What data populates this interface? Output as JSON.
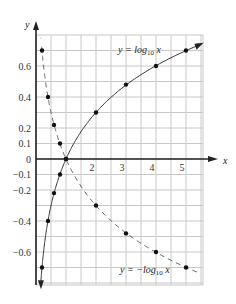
{
  "chart_data": {
    "type": "line",
    "title": "",
    "xlabel": "x",
    "ylabel": "y",
    "xlim": [
      0,
      5.5
    ],
    "ylim": [
      -0.8,
      0.8
    ],
    "grid": true,
    "legend_position": "inline",
    "x_ticks": [
      "1",
      "2",
      "3",
      "4",
      "5"
    ],
    "x_tick_values": [
      1,
      2,
      3,
      4,
      5
    ],
    "y_ticks": [
      "0.6",
      "0.4",
      "0.2",
      "0.1",
      "0",
      "-0.1",
      "-0.2",
      "-0.4",
      "-0.6"
    ],
    "y_tick_values": [
      0.6,
      0.4,
      0.2,
      0.1,
      0,
      -0.1,
      -0.2,
      -0.4,
      -0.6
    ],
    "series": [
      {
        "name": "y = log10 x",
        "style": "solid",
        "label_main": "y = log",
        "label_sub": "10",
        "label_tail": " x",
        "x": [
          0.2,
          0.4,
          0.6,
          0.8,
          1,
          2,
          3,
          4,
          5
        ],
        "values": [
          -0.7,
          -0.4,
          -0.22,
          -0.1,
          0,
          0.3,
          0.48,
          0.6,
          0.7
        ]
      },
      {
        "name": "y = -log10 x",
        "style": "dashed",
        "label_main": "y = −log",
        "label_sub": "10",
        "label_tail": " x",
        "x": [
          0.2,
          0.4,
          0.6,
          0.8,
          1,
          2,
          3,
          4,
          5
        ],
        "values": [
          0.7,
          0.4,
          0.22,
          0.1,
          0,
          -0.3,
          -0.48,
          -0.6,
          -0.7
        ]
      }
    ]
  }
}
